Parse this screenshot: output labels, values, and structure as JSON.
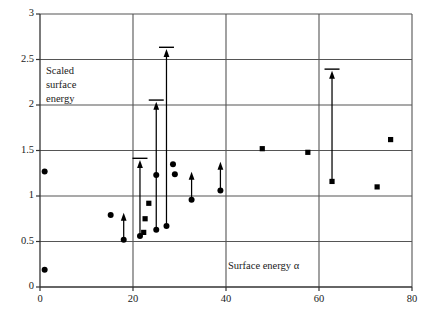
{
  "chart_data": {
    "type": "scatter",
    "title": "",
    "xlabel": "Surface energy α",
    "ylabel": "Scaled surface energy",
    "xlim": [
      0,
      80
    ],
    "ylim": [
      0,
      3
    ],
    "xticks": [
      0,
      20,
      40,
      60,
      80
    ],
    "yticks": [
      0,
      0.5,
      1,
      1.5,
      2,
      2.5,
      3
    ],
    "xtick_labels": [
      "0",
      "20",
      "40",
      "60",
      "80"
    ],
    "ytick_labels": [
      "0",
      "0.5",
      "1",
      "1.5",
      "2",
      "2.5",
      "3"
    ],
    "grid": "both",
    "legend": "none",
    "series": [
      {
        "name": "diamond-points",
        "marker": "diamond",
        "color": "#000000",
        "points": [
          {
            "x": 1.0,
            "y": 1.27
          },
          {
            "x": 1.0,
            "y": 0.19
          },
          {
            "x": 15.2,
            "y": 0.79
          },
          {
            "x": 18.0,
            "y": 0.52
          },
          {
            "x": 21.5,
            "y": 0.56
          },
          {
            "x": 25.0,
            "y": 0.63
          },
          {
            "x": 25.0,
            "y": 1.23
          },
          {
            "x": 27.2,
            "y": 0.67
          },
          {
            "x": 28.6,
            "y": 1.35
          },
          {
            "x": 29.0,
            "y": 1.24
          },
          {
            "x": 32.6,
            "y": 0.96
          },
          {
            "x": 38.8,
            "y": 1.06
          }
        ]
      },
      {
        "name": "square-points",
        "marker": "square",
        "color": "#000000",
        "points": [
          {
            "x": 22.6,
            "y": 0.75
          },
          {
            "x": 22.3,
            "y": 0.6
          },
          {
            "x": 23.4,
            "y": 0.92
          },
          {
            "x": 47.8,
            "y": 1.52
          },
          {
            "x": 57.6,
            "y": 1.48
          },
          {
            "x": 62.8,
            "y": 1.16
          },
          {
            "x": 72.5,
            "y": 1.1
          },
          {
            "x": 75.4,
            "y": 1.62
          }
        ]
      }
    ],
    "arrows": [
      {
        "x": 18.0,
        "y_start": 0.52,
        "y_end": 0.81,
        "cap": false
      },
      {
        "x": 21.5,
        "y_start": 0.56,
        "y_end": 1.39,
        "cap": true
      },
      {
        "x": 25.0,
        "y_start": 0.63,
        "y_end": 2.03,
        "cap": true
      },
      {
        "x": 27.2,
        "y_start": 0.67,
        "y_end": 2.61,
        "cap": true
      },
      {
        "x": 32.6,
        "y_start": 0.96,
        "y_end": 1.26,
        "cap": false
      },
      {
        "x": 38.8,
        "y_start": 1.06,
        "y_end": 1.37,
        "cap": false
      },
      {
        "x": 62.8,
        "y_start": 1.16,
        "y_end": 2.37,
        "cap": true
      }
    ]
  },
  "axis": {
    "y_title": "Scaled\nsurface\nenergy",
    "x_title": "Surface energy α"
  },
  "colors": {
    "marker": "#000000",
    "grid": "#555555",
    "axis": "#333333",
    "background": "#ffffff"
  }
}
